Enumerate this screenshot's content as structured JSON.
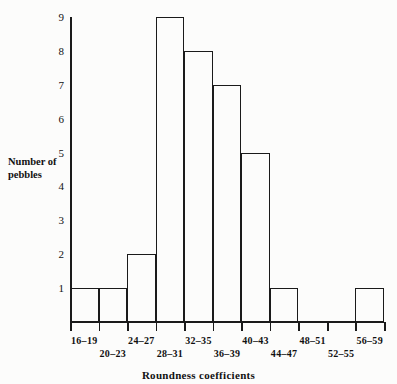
{
  "chart_data": {
    "type": "bar",
    "title": "",
    "xlabel": "Roundness coefficients",
    "ylabel": "Number of pebbles",
    "categories": [
      "16–19",
      "20–23",
      "24–27",
      "28–31",
      "32–35",
      "36–39",
      "40–43",
      "44–47",
      "48–51",
      "52–55",
      "56–59"
    ],
    "values": [
      1,
      1,
      2,
      9,
      8,
      7,
      5,
      1,
      0,
      0,
      1
    ],
    "ylim": [
      0,
      9
    ],
    "yticks": [
      "1",
      "2",
      "3",
      "4",
      "5",
      "6",
      "7",
      "8",
      "9"
    ],
    "grid": false,
    "legend": null,
    "bar_style": "histogram-outline-adjacent",
    "colors": {
      "line": "#1a1a1a",
      "background": "#fcfcfb",
      "fill": "none"
    }
  },
  "axis": {
    "y_title": "Number of\npebbles",
    "y_title_line1": "Number of",
    "y_title_line2": "pebbles",
    "x_title": "Roundness coefficients"
  },
  "y_ticks": [
    {
      "label": "9"
    },
    {
      "label": "8"
    },
    {
      "label": "7"
    },
    {
      "label": "6"
    },
    {
      "label": "5"
    },
    {
      "label": "4"
    },
    {
      "label": "3"
    },
    {
      "label": "2"
    },
    {
      "label": "1"
    }
  ],
  "x_bins": [
    {
      "label": "16–19",
      "value": 1,
      "row": "a"
    },
    {
      "label": "20–23",
      "value": 1,
      "row": "b"
    },
    {
      "label": "24–27",
      "value": 2,
      "row": "a"
    },
    {
      "label": "28–31",
      "value": 9,
      "row": "b"
    },
    {
      "label": "32–35",
      "value": 8,
      "row": "a"
    },
    {
      "label": "36–39",
      "value": 7,
      "row": "b"
    },
    {
      "label": "40–43",
      "value": 5,
      "row": "a"
    },
    {
      "label": "44–47",
      "value": 1,
      "row": "b"
    },
    {
      "label": "48–51",
      "value": 0,
      "row": "a"
    },
    {
      "label": "52–55",
      "value": 0,
      "row": "b"
    },
    {
      "label": "56–59",
      "value": 1,
      "row": "a"
    }
  ]
}
